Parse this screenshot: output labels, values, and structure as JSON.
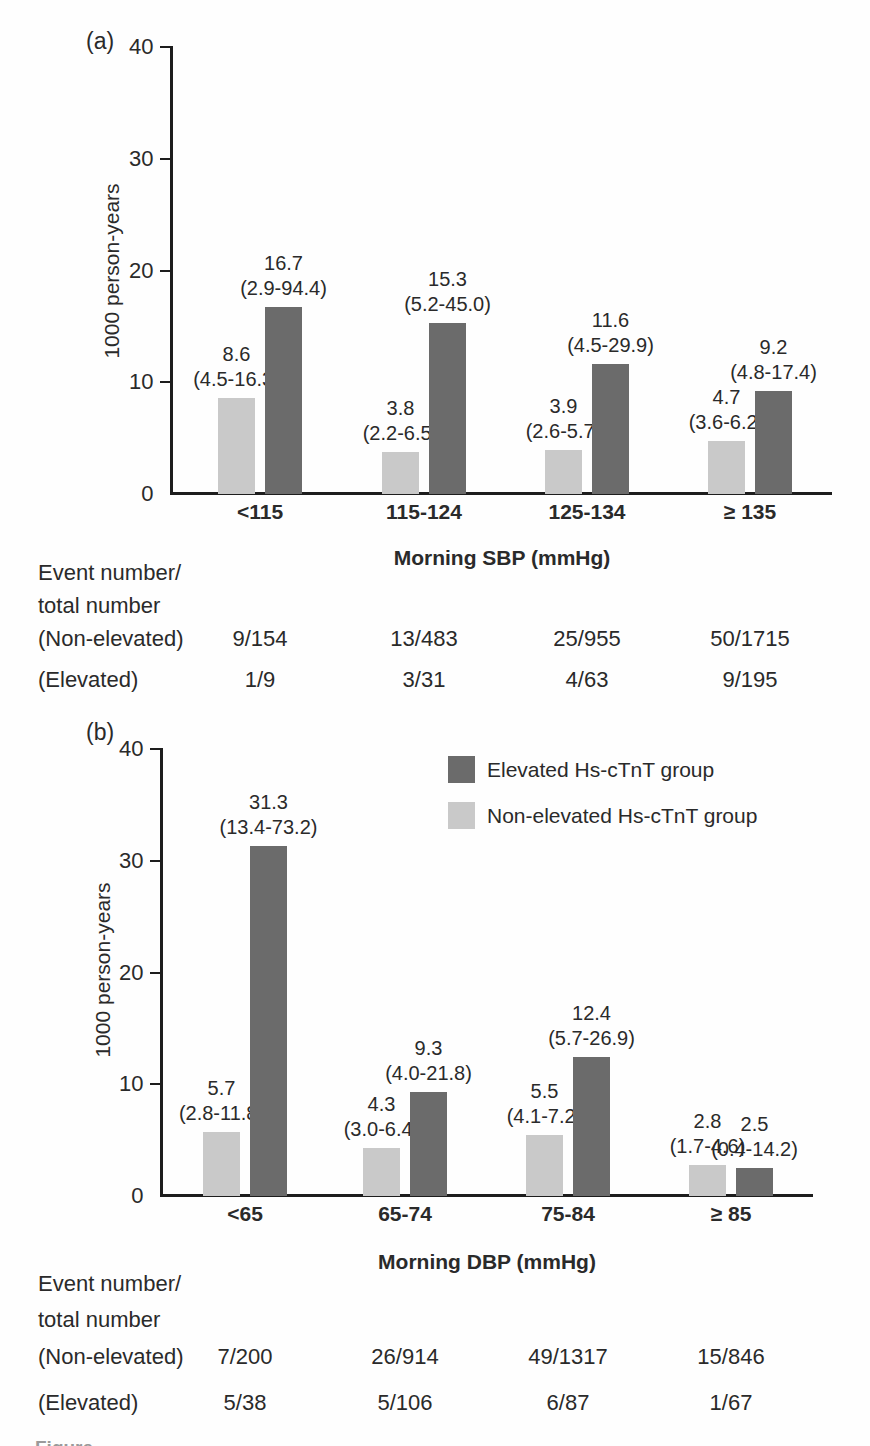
{
  "colors": {
    "elevated_bar": "#6b6b6b",
    "non_elevated_bar": "#c9c9c9",
    "axis": "#1d1d1d",
    "text": "#2a2a2a"
  },
  "legend": {
    "items": [
      {
        "label": "Elevated Hs-cTnT group",
        "color_key": "elevated_bar"
      },
      {
        "label": "Non-elevated Hs-cTnT group",
        "color_key": "non_elevated_bar"
      }
    ]
  },
  "cropped_caption": "Figure",
  "chart_data": [
    {
      "type": "bar",
      "panel_label": "(a)",
      "title": "",
      "xlabel": "Morning SBP (mmHg)",
      "ylabel": "1000 person-years",
      "ylim": [
        0,
        40
      ],
      "yticks": [
        0,
        10,
        20,
        30,
        40
      ],
      "grid": false,
      "categories": [
        "<115",
        "115-124",
        "125-134",
        "≥ 135"
      ],
      "series": [
        {
          "name": "Non-elevated Hs-cTnT group",
          "color_key": "non_elevated_bar",
          "values": [
            8.6,
            3.8,
            3.9,
            4.7
          ],
          "ci_labels": [
            "(4.5-16.3)",
            "(2.2-6.5)",
            "(2.6-5.7)",
            "(3.6-6.2)"
          ]
        },
        {
          "name": "Elevated Hs-cTnT group",
          "color_key": "elevated_bar",
          "values": [
            16.7,
            15.3,
            11.6,
            9.2
          ],
          "ci_labels": [
            "(2.9-94.4)",
            "(5.2-45.0)",
            "(4.5-29.9)",
            "(4.8-17.4)"
          ]
        }
      ],
      "table": {
        "header": "Event number/\ntotal number",
        "rows": [
          {
            "label": "(Non-elevated)",
            "values": [
              "9/154",
              "13/483",
              "25/955",
              "50/1715"
            ]
          },
          {
            "label": "(Elevated)",
            "values": [
              "1/9",
              "3/31",
              "4/63",
              "9/195"
            ]
          }
        ]
      }
    },
    {
      "type": "bar",
      "panel_label": "(b)",
      "title": "",
      "xlabel": "Morning DBP (mmHg)",
      "ylabel": "1000 person-years",
      "ylim": [
        0,
        40
      ],
      "yticks": [
        0,
        10,
        20,
        30,
        40
      ],
      "grid": false,
      "legend_position": "upper-right",
      "categories": [
        "<65",
        "65-74",
        "75-84",
        "≥ 85"
      ],
      "series": [
        {
          "name": "Non-elevated Hs-cTnT group",
          "color_key": "non_elevated_bar",
          "values": [
            5.7,
            4.3,
            5.5,
            2.8
          ],
          "ci_labels": [
            "(2.8-11.8)",
            "(3.0-6.4)",
            "(4.1-7.2)",
            "(1.7-4.6)"
          ]
        },
        {
          "name": "Elevated Hs-cTnT group",
          "color_key": "elevated_bar",
          "values": [
            31.3,
            9.3,
            12.4,
            2.5
          ],
          "ci_labels": [
            "(13.4-73.2)",
            "(4.0-21.8)",
            "(5.7-26.9)",
            "(0.4-14.2)"
          ]
        }
      ],
      "table": {
        "header": "Event number/\ntotal number",
        "rows": [
          {
            "label": "(Non-elevated)",
            "values": [
              "7/200",
              "26/914",
              "49/1317",
              "15/846"
            ]
          },
          {
            "label": "(Elevated)",
            "values": [
              "5/38",
              "5/106",
              "6/87",
              "1/67"
            ]
          }
        ]
      }
    }
  ]
}
